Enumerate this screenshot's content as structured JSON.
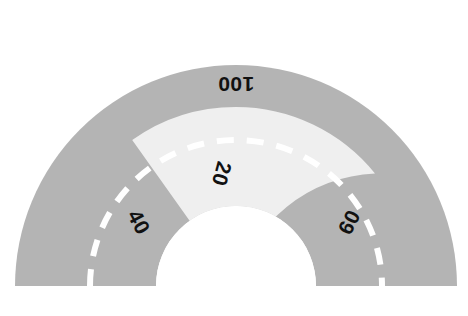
{
  "figure": {
    "kind": "half-donut-gauge",
    "background_color": "#ffffff"
  },
  "colors": {
    "ring_gray": "#b4b4b4",
    "wedge_light": "#efefef",
    "dashed_arc": "#ffffff",
    "label_text": "#111111",
    "hole": "#ffffff"
  },
  "geometry": {
    "center_x": 236,
    "center_y": 286,
    "outer_radius": 221,
    "inner_radius": 80,
    "dashed_arc_radius": 146,
    "wedge_start_deg": 118,
    "wedge_end_deg": 66
  },
  "labels": [
    {
      "name": "label-100",
      "text": "100",
      "x": 236,
      "y": 84,
      "rotation_deg": 180
    },
    {
      "name": "label-20",
      "text": "20",
      "x": 222,
      "y": 174,
      "rotation_deg": 105
    },
    {
      "name": "label-40",
      "text": "40",
      "x": 139,
      "y": 222,
      "rotation_deg": 62
    },
    {
      "name": "label-60",
      "text": "60",
      "x": 349,
      "y": 222,
      "rotation_deg": -62
    }
  ],
  "chart_data": {
    "type": "pie",
    "title": "",
    "subtitle": "",
    "xlabel": "",
    "ylabel": "",
    "legend_position": "none",
    "grid": false,
    "shape": "half-donut",
    "start_angle_deg": 180,
    "end_angle_deg": 0,
    "hole_fraction": 0.36,
    "categories": [
      "100",
      "20",
      "40",
      "60"
    ],
    "values": [
      100,
      20,
      40,
      60
    ],
    "tick_labels": [
      "100",
      "20",
      "40",
      "60"
    ],
    "annotations": [
      {
        "text": "100",
        "orientation": "radial-inverted"
      },
      {
        "text": "20",
        "orientation": "radial"
      },
      {
        "text": "40",
        "orientation": "radial"
      },
      {
        "text": "60",
        "orientation": "radial"
      }
    ],
    "series": [
      {
        "name": "gauge-ring",
        "values": [
          100,
          20,
          40,
          60
        ]
      }
    ],
    "highlight_segment": {
      "label": "20",
      "fill": "#efefef"
    },
    "reference_arc": {
      "style": "dashed",
      "color": "#ffffff",
      "radius_fraction": 0.66
    }
  }
}
